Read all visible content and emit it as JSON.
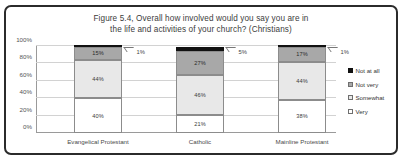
{
  "chart_data": {
    "type": "bar",
    "subtype": "stacked-column-100",
    "title": "Figure 5.4, Overall how involved would you say you are in the life and activities of your church? (Christians)",
    "title_line1": "Figure 5.4, Overall how involved would you say you are in",
    "title_line2": "the life and activities of your church? (Christians)",
    "xlabel": "",
    "ylabel": "",
    "ylim": [
      0,
      100
    ],
    "grid": true,
    "legend_position": "right",
    "categories": [
      "Evangelical Protestant",
      "Catholic",
      "Mainline Protestant"
    ],
    "ticks": [
      "0%",
      "20%",
      "40%",
      "60%",
      "80%",
      "100%"
    ],
    "tick_values": [
      0,
      20,
      40,
      60,
      80,
      100
    ],
    "series": [
      {
        "name": "Very",
        "color": "#ffffff",
        "values": [
          40,
          21,
          38
        ],
        "labels": [
          "40%",
          "21%",
          "38%"
        ]
      },
      {
        "name": "Somewhat",
        "color": "#e8e8e8",
        "values": [
          44,
          46,
          44
        ],
        "labels": [
          "44%",
          "46%",
          "44%"
        ]
      },
      {
        "name": "Not very",
        "color": "#a8a8a8",
        "values": [
          15,
          27,
          17
        ],
        "labels": [
          "15%",
          "27%",
          "17%"
        ]
      },
      {
        "name": "Not at all",
        "color": "#111111",
        "values": [
          1,
          5,
          1
        ],
        "labels": [
          "1%",
          "5%",
          "1%"
        ]
      }
    ],
    "callouts": [
      "1%",
      "5%",
      "1%"
    ]
  },
  "legend": {
    "items": [
      {
        "label": "Not at all"
      },
      {
        "label": "Not very"
      },
      {
        "label": "Somewhat"
      },
      {
        "label": "Very"
      }
    ]
  }
}
